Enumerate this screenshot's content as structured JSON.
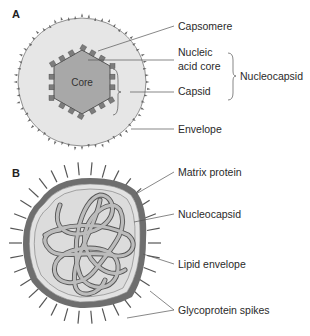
{
  "panels": [
    {
      "id": "A",
      "label": "A",
      "center_label": "Core",
      "labels": {
        "capsomere": "Capsomere",
        "nucleic_line1": "Nucleic",
        "nucleic_line2": "acid core",
        "capsid": "Capsid",
        "nucleocapsid": "Nucleocapsid",
        "envelope": "Envelope"
      }
    },
    {
      "id": "B",
      "label": "B",
      "labels": {
        "matrix_protein": "Matrix protein",
        "nucleocapsid": "Nucleocapsid",
        "lipid_envelope": "Lipid envelope",
        "glycoprotein_spikes": "Glycoprotein spikes"
      }
    }
  ],
  "colors": {
    "envelope_fill": "#e6e6e6",
    "core_fill": "#a8a8a8",
    "capsomere_fill": "#8a8a8a",
    "membrane": "#6e6e6e",
    "strand": "#b9b9b9"
  }
}
